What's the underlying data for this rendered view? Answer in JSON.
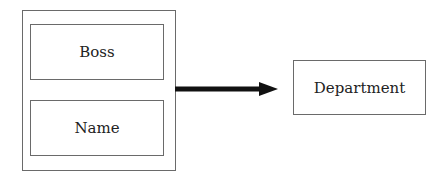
{
  "diagram": {
    "group": {
      "fields": [
        {
          "label": "Boss"
        },
        {
          "label": "Name"
        }
      ]
    },
    "target": {
      "label": "Department"
    },
    "edge": {
      "from": "group",
      "to": "target",
      "type": "arrow"
    }
  }
}
